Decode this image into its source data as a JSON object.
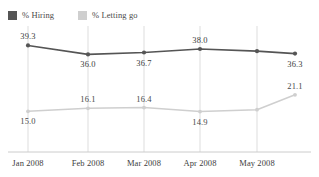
{
  "legend": {
    "position": "top-left",
    "entries": [
      {
        "label": "% Hiring",
        "color": "#555555",
        "key": "hiring"
      },
      {
        "label": "% Letting go",
        "color": "#cfcfcf",
        "key": "letting_go"
      }
    ]
  },
  "chart_data": {
    "type": "line",
    "title": "",
    "subtitle": "",
    "xlabel": "",
    "ylabel": "",
    "grid": "vertical",
    "ylim": [
      0,
      45
    ],
    "categories": [
      "Jan 2008",
      "Feb 2008",
      "Mar 2008",
      "Apr 2008",
      "May 2008",
      ""
    ],
    "tick_labels": [
      "Jan 2008",
      "Feb 2008",
      "Mar 2008",
      "Apr 2008",
      "May 2008"
    ],
    "series": [
      {
        "name": "% Hiring",
        "color": "#555555",
        "values": [
          39.3,
          36.0,
          36.7,
          38.0,
          37.2,
          36.3
        ],
        "labels": [
          "39.3",
          "36.0",
          "36.7",
          "38.0",
          "",
          "36.3"
        ],
        "label_positions": [
          "above",
          "below",
          "below",
          "above",
          "",
          "below"
        ]
      },
      {
        "name": "% Letting go",
        "color": "#cfcfcf",
        "values": [
          15.0,
          16.1,
          16.4,
          14.9,
          15.6,
          21.1
        ],
        "labels": [
          "15.0",
          "16.1",
          "16.4",
          "14.9",
          "",
          "21.1"
        ],
        "label_positions": [
          "below",
          "above",
          "above",
          "below",
          "",
          "above"
        ]
      }
    ]
  },
  "axis": {
    "baseline_color": "#cccccc",
    "gridline_color": "#dddddd"
  }
}
